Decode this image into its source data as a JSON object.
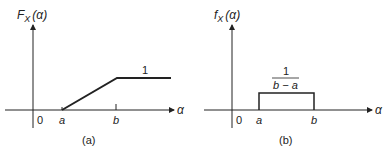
{
  "panels": [
    {
      "id": "a",
      "caption": "(a)",
      "ylabel_main": "F",
      "ylabel_sub": "X",
      "ylabel_arg": "(α)",
      "xlabel": "α",
      "origin_label": "0",
      "tick_a": "a",
      "tick_b": "b",
      "plateau_label": "1",
      "type": "cdf"
    },
    {
      "id": "b",
      "caption": "(b)",
      "ylabel_main": "f",
      "ylabel_sub": "X",
      "ylabel_arg": "(α)",
      "xlabel": "α",
      "origin_label": "0",
      "tick_a": "a",
      "tick_b": "b",
      "height_num": "1",
      "height_den": "b − a",
      "type": "pdf"
    }
  ],
  "colors": {
    "ink": "#222222",
    "background": "#ffffff"
  }
}
